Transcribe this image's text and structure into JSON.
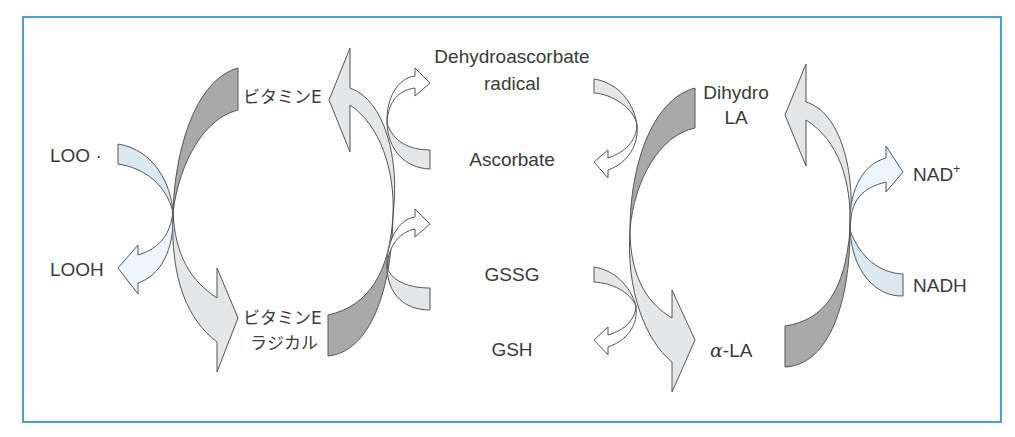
{
  "diagram": {
    "type": "antioxidant redox cycle network",
    "frame_color": "#4a9fd8",
    "colors": {
      "dark_fill": "#a9a9a9",
      "light_fill": "#e4e6e8",
      "blue_fill": "#dce8f0",
      "very_light_blue_fill": "#eef5fa",
      "white_fill": "#ffffff",
      "stroke": "#555555"
    },
    "labels": {
      "loo_radical": "LOO ·",
      "looh": "LOOH",
      "vitamin_e": "ビタミンE",
      "vitamin_e_radical_line1": "ビタミンE",
      "vitamin_e_radical_line2": "ラジカル",
      "dehydroascorbate_line1": "Dehydroascorbate",
      "dehydroascorbate_line2": "radical",
      "ascorbate": "Ascorbate",
      "gssg": "GSSG",
      "gsh": "GSH",
      "dihydro_la_line1": "Dihydro",
      "dihydro_la_line2": "LA",
      "alpha_symbol": "α",
      "alpha_la_suffix": "-LA",
      "nad_plus": "NAD",
      "nad_plus_sup": "+",
      "nadh": "NADH"
    },
    "cycles": [
      {
        "name": "lipid peroxyl / vitamin E",
        "reactant": "LOO ·",
        "product": "LOOH"
      },
      {
        "name": "vitamin E / ascorbate",
        "reduced": "ビタミンE",
        "oxidized": "ビタミンE ラジカル"
      },
      {
        "name": "ascorbate / glutathione",
        "pairs": [
          [
            "Dehydroascorbate radical",
            "Ascorbate"
          ],
          [
            "GSSG",
            "GSH"
          ]
        ]
      },
      {
        "name": "lipoic acid / NADH",
        "reduced": "Dihydro LA",
        "oxidized": "α-LA",
        "cofactor": [
          "NADH",
          "NAD+"
        ]
      }
    ]
  }
}
